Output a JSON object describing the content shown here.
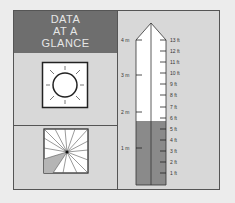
{
  "header": {
    "lines": [
      "DATA",
      "AT A",
      "GLANCE"
    ]
  },
  "icons": {
    "top": "sun-icon",
    "bottom": "compass-wheel-icon"
  },
  "gauge": {
    "metric_labels": [
      "4 m",
      "3 m",
      "2 m",
      "1 m"
    ],
    "feet_labels": [
      "13 ft",
      "12 ft",
      "11 ft",
      "10 ft",
      "9 ft",
      "8 ft",
      "7 ft",
      "6 ft",
      "5 ft",
      "4 ft",
      "3 ft",
      "2 ft",
      "1 ft"
    ],
    "fill_level_ft": 6,
    "fill_color": "#8a8a8a",
    "empty_color": "#ffffff"
  },
  "colors": {
    "header_bg": "#6e6e6e",
    "panel_bg": "#d8d8d8",
    "header_text": "#e6e6e6"
  }
}
